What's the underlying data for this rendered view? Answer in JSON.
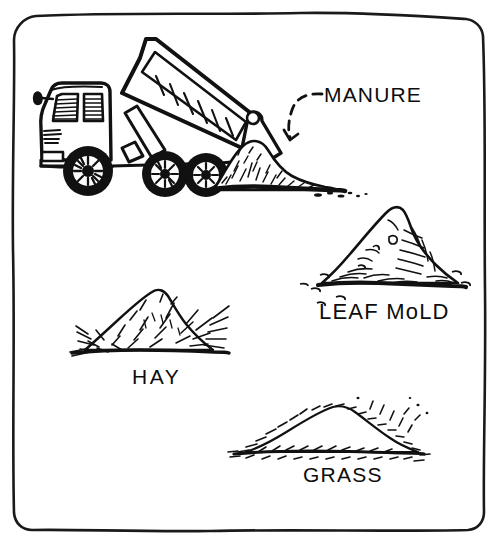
{
  "illustration": {
    "title": "Compost materials line drawing",
    "style": "hand-drawn black ink on white",
    "background_color": "#ffffff",
    "ink_color": "#111111",
    "frame": {
      "name": "hand-drawn-rounded-border",
      "stroke_color": "#1a1a1a"
    }
  },
  "labels": {
    "manure": "MANURE",
    "leaf_mold": "LEAF MoLD",
    "hay": "HAY",
    "grass": "GRASS"
  },
  "elements": {
    "truck": {
      "name": "dump-truck",
      "description": "dump truck with raised bed unloading manure",
      "parts": [
        "cab",
        "side-mirror",
        "grille",
        "dump-bed",
        "hydraulic-arm",
        "front-wheel",
        "rear-wheel-1",
        "rear-wheel-2"
      ]
    },
    "arrow": {
      "name": "dashed-pointer-arrow",
      "description": "curved dashed arrow pointing from MANURE label to the pile"
    },
    "piles": [
      {
        "name": "manure-pile",
        "label": "MANURE",
        "texture": "dense clumped"
      },
      {
        "name": "leaf-mold-pile",
        "label": "LEAF MoLD",
        "texture": "peaked with scattered leaves"
      },
      {
        "name": "hay-pile",
        "label": "HAY",
        "texture": "spiky straw strands"
      },
      {
        "name": "grass-pile",
        "label": "GRASS",
        "texture": "low mound with short clippings"
      }
    ]
  }
}
